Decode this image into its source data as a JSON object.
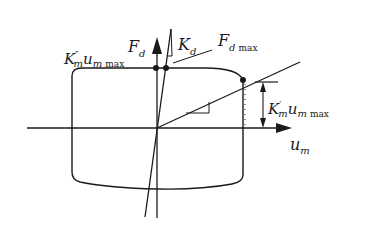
{
  "diagram": {
    "type": "force-displacement hysteresis diagram",
    "axes": {
      "vertical": {
        "symbol": "F",
        "subscript": "d"
      },
      "horizontal": {
        "symbol": "u",
        "subscript": "m"
      }
    },
    "labels": {
      "km_double_prime": {
        "main": "K",
        "sup": "″",
        "sub": "m",
        "var": "u",
        "var_sub": "m",
        "max": "max"
      },
      "kd": {
        "main": "K",
        "sub": "d"
      },
      "fdmax": {
        "main": "F",
        "sub": "d",
        "max": "max"
      },
      "km_prime": {
        "main": "K",
        "sup": "′",
        "sub": "m",
        "var": "u",
        "var_sub": "m",
        "max": "max"
      }
    },
    "colors": {
      "stroke": "#1a1a1a",
      "background": "#ffffff"
    }
  }
}
